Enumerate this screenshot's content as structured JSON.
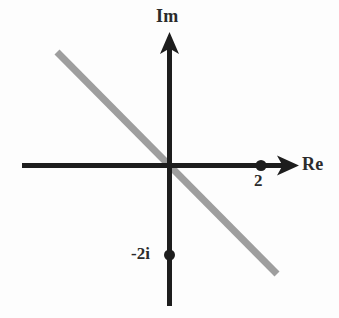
{
  "figure": {
    "title": "",
    "background_color": "#fdfdfd"
  },
  "axes": {
    "imaginary": {
      "label": "Im",
      "color": "#1d1d1d",
      "origin_x": 169,
      "top_y": 33,
      "bottom_y": 306,
      "arrow": "up-arrow-icon"
    },
    "real": {
      "label": "Re",
      "color": "#1d1d1d",
      "origin_y": 165,
      "left_x": 22,
      "right_x": 298,
      "arrow": "right-arrow-icon"
    },
    "origin": {
      "x": 169,
      "y": 165
    }
  },
  "points": [
    {
      "name": "point-2",
      "label": "2",
      "complex_value": "2",
      "re": 2,
      "im": 0,
      "px": 261,
      "py": 165,
      "color": "#1d1d1d",
      "radius": 5.5
    },
    {
      "name": "point-minus-2i",
      "label": "-2i",
      "complex_value": "-2i",
      "re": 0,
      "im": -2,
      "px": 170,
      "py": 255,
      "color": "#1d1d1d",
      "radius": 5.5
    }
  ],
  "line": {
    "name": "gray-line",
    "color": "#9e9e9e",
    "width": 7,
    "from": {
      "x": 57,
      "y": 52
    },
    "to": {
      "x": 277,
      "y": 274
    },
    "slope": -1,
    "description": "line through origin with slope -1"
  },
  "chart_data": {
    "type": "scatter",
    "title": "",
    "xlabel": "Re",
    "ylabel": "Im",
    "xlim": [
      -3.25,
      2.85
    ],
    "ylim": [
      -3.1,
      2.9
    ],
    "grid": false,
    "legend": null,
    "points": [
      {
        "label": "2",
        "x": 2,
        "y": 0
      },
      {
        "label": "-2i",
        "x": 0,
        "y": -2
      }
    ],
    "lines": [
      {
        "name": "gray-line",
        "color": "#9e9e9e",
        "slope": -1,
        "intercept": 0,
        "x_range": [
          -2.48,
          2.38
        ]
      }
    ],
    "annotations": [
      "Im",
      "Re",
      "2",
      "-2i"
    ]
  }
}
